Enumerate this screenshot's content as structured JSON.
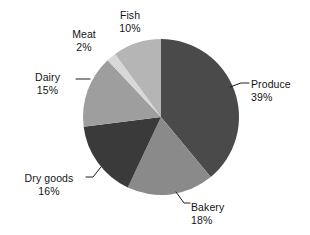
{
  "chart_data": {
    "type": "pie",
    "title": "",
    "subtitle": "",
    "xlabel": "",
    "ylabel": "",
    "legend_position": "none",
    "grid": false,
    "start_angle_deg": 0,
    "direction": "clockwise",
    "categories": [
      "Produce",
      "Bakery",
      "Dry goods",
      "Dairy",
      "Meat",
      "Fish"
    ],
    "values": [
      39,
      18,
      16,
      15,
      2,
      10
    ],
    "unit": "%",
    "slices": [
      {
        "label": "Produce",
        "value": 39,
        "value_text": "39%",
        "color": "#4a4a4a"
      },
      {
        "label": "Bakery",
        "value": 18,
        "value_text": "18%",
        "color": "#8a8a8a"
      },
      {
        "label": "Dry goods",
        "value": 16,
        "value_text": "16%",
        "color": "#3a3a3a"
      },
      {
        "label": "Dairy",
        "value": 15,
        "value_text": "15%",
        "color": "#9e9e9e"
      },
      {
        "label": "Meat",
        "value": 2,
        "value_text": "2%",
        "color": "#d8d8d8"
      },
      {
        "label": "Fish",
        "value": 10,
        "value_text": "10%",
        "color": "#b5b5b5"
      }
    ],
    "annotations": [
      {
        "name": "produce",
        "label": "Produce",
        "value_text": "39%"
      },
      {
        "name": "bakery",
        "label": "Bakery",
        "value_text": "18%"
      },
      {
        "name": "drygoods",
        "label": "Dry goods",
        "value_text": "16%"
      },
      {
        "name": "dairy",
        "label": "Dairy",
        "value_text": "15%"
      },
      {
        "name": "meat",
        "label": "Meat",
        "value_text": "2%"
      },
      {
        "name": "fish",
        "label": "Fish",
        "value_text": "10%"
      }
    ],
    "colors": {
      "background": "#ffffff",
      "text": "#141414",
      "leader_line": "#1e1e1e"
    }
  }
}
